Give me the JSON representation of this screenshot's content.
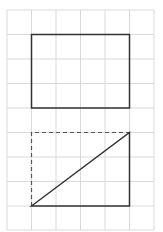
{
  "canvas": {
    "width": 163,
    "height": 232,
    "background": "#ffffff"
  },
  "grid": {
    "color": "#d9d9d9",
    "x_lines": [
      7,
      31.5,
      56,
      80.5,
      105,
      129.5,
      154
    ],
    "y_lines": [
      10,
      34.5,
      59,
      83.5,
      108,
      132.5,
      157,
      181.5,
      206,
      230
    ]
  },
  "shapes": {
    "rectangle": {
      "x1": 31.5,
      "y1": 34.5,
      "x2": 129.5,
      "y2": 108,
      "stroke": "#333333"
    },
    "triangle": {
      "points": [
        [
          31.5,
          206
        ],
        [
          129.5,
          132.5
        ],
        [
          129.5,
          206
        ]
      ],
      "stroke": "#333333"
    },
    "dashed_completion": {
      "points": [
        [
          31.5,
          206
        ],
        [
          31.5,
          132.5
        ],
        [
          129.5,
          132.5
        ]
      ],
      "stroke": "#555555",
      "dash": "4,3"
    }
  }
}
